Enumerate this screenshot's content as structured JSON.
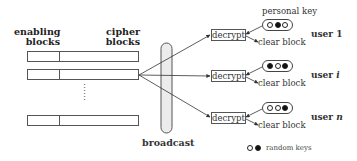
{
  "headers": {
    "enabling": [
      "enabling",
      "blocks"
    ],
    "cipher": [
      "cipher",
      "blocks"
    ]
  },
  "broadcast_label": "broadcast",
  "personal_key_label": "personal key",
  "users": [
    {
      "name": "user",
      "suffix": "1",
      "decrypt_label": "decrypt",
      "clear_label": "clear block",
      "key": [
        "empty",
        "filled",
        "empty"
      ]
    },
    {
      "name": "user",
      "suffix": "i",
      "decrypt_label": "decrypt",
      "clear_label": "clear block",
      "key": [
        "filled",
        "empty",
        "filled"
      ]
    },
    {
      "name": "user",
      "suffix": "n",
      "decrypt_label": "decrypt",
      "clear_label": "clear block",
      "key": [
        "empty",
        "empty",
        "filled"
      ]
    }
  ],
  "legend": {
    "label": "random keys",
    "symbols": [
      "empty",
      "filled"
    ]
  },
  "ellipsis": "⋮"
}
